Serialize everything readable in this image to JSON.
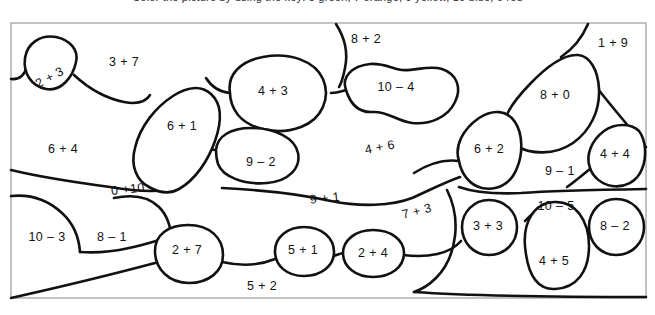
{
  "page": {
    "kind": "coloring-worksheet",
    "top_cut_text": "Color the picture by using the key: 5 green, 7 orange, 9 yellow, 10 blue, 6 red",
    "frame": {
      "x": 11,
      "y": 23,
      "width": 635,
      "height": 275
    },
    "ink_color": "#111111",
    "paper_color": "#ffffff",
    "frame_color": "#9a9a9a"
  },
  "regions": [
    {
      "id": "r-2plus3",
      "label": "2 + 3",
      "x": 50,
      "y": 78,
      "rotate": -28
    },
    {
      "id": "r-3plus7",
      "label": "3 + 7",
      "x": 124,
      "y": 63,
      "rotate": 0
    },
    {
      "id": "r-6plus4",
      "label": "6 + 4",
      "x": 63,
      "y": 150,
      "rotate": 0
    },
    {
      "id": "r-6plus1",
      "label": "6 + 1",
      "x": 182,
      "y": 127,
      "rotate": 0
    },
    {
      "id": "r-0plus10",
      "label": "0 +10",
      "x": 128,
      "y": 190,
      "rotate": -6
    },
    {
      "id": "r-10minus3",
      "label": "10 – 3",
      "x": 47,
      "y": 238,
      "rotate": 0
    },
    {
      "id": "r-8minus1",
      "label": "8 – 1",
      "x": 112,
      "y": 238,
      "rotate": 0
    },
    {
      "id": "r-2plus7",
      "label": "2 + 7",
      "x": 187,
      "y": 251,
      "rotate": 0
    },
    {
      "id": "r-4plus3",
      "label": "4 + 3",
      "x": 273,
      "y": 92,
      "rotate": 0
    },
    {
      "id": "r-9minus2",
      "label": "9 – 2",
      "x": 261,
      "y": 163,
      "rotate": 0
    },
    {
      "id": "r-5plus1",
      "label": "5 + 1",
      "x": 303,
      "y": 251,
      "rotate": 0
    },
    {
      "id": "r-2plus4",
      "label": "2 + 4",
      "x": 373,
      "y": 254,
      "rotate": 0
    },
    {
      "id": "r-5plus2",
      "label": "5 + 2",
      "x": 262,
      "y": 287,
      "rotate": 0
    },
    {
      "id": "r-9plus1",
      "label": "9 + 1",
      "x": 325,
      "y": 199,
      "rotate": -6
    },
    {
      "id": "r-8plus2",
      "label": "8 + 2",
      "x": 366,
      "y": 40,
      "rotate": 0
    },
    {
      "id": "r-10minus4",
      "label": "10 – 4",
      "x": 396,
      "y": 88,
      "rotate": 0
    },
    {
      "id": "r-4plus6",
      "label": "4 + 6",
      "x": 380,
      "y": 148,
      "rotate": -11
    },
    {
      "id": "r-7plus3",
      "label": "7 + 3",
      "x": 417,
      "y": 212,
      "rotate": -14
    },
    {
      "id": "r-6plus2",
      "label": "6 + 2",
      "x": 489,
      "y": 150,
      "rotate": 0
    },
    {
      "id": "r-8plus0",
      "label": "8 + 0",
      "x": 555,
      "y": 96,
      "rotate": 0
    },
    {
      "id": "r-1plus9",
      "label": "1 + 9",
      "x": 613,
      "y": 44,
      "rotate": 0
    },
    {
      "id": "r-9minus1",
      "label": "9 – 1",
      "x": 560,
      "y": 172,
      "rotate": 0
    },
    {
      "id": "r-4plus4",
      "label": "4 + 4",
      "x": 615,
      "y": 155,
      "rotate": 0
    },
    {
      "id": "r-3plus3",
      "label": "3 + 3",
      "x": 488,
      "y": 227,
      "rotate": 0
    },
    {
      "id": "r-10minus5",
      "label": "10 – 5",
      "x": 556,
      "y": 207,
      "rotate": 0
    },
    {
      "id": "r-4plus5",
      "label": "4 + 5",
      "x": 554,
      "y": 262,
      "rotate": 0
    },
    {
      "id": "r-8minus2",
      "label": "8 – 2",
      "x": 615,
      "y": 227,
      "rotate": 0
    }
  ],
  "shapes": {
    "outer_frame": "M11,23 L646,23 L646,298 L11,298 Z",
    "blob_2plus3": "M75,62 C78,51 70,41 56,38 C40,35 28,44 25,58 C22,72 30,85 45,88 C60,91 72,77 75,62 Z",
    "blob_6plus1": "M148,186 C136,180 130,166 134,148 C139,126 155,108 172,97 C186,88 200,86 210,94 C221,103 221,121 214,140 C207,160 194,179 178,188 C166,195 155,190 148,186 Z",
    "blob_4plus3": "M229,93 C226,76 239,62 262,58 C289,53 314,62 322,79 C330,97 321,118 300,126 C276,135 249,128 237,114 C231,106 229,99 229,93 Z",
    "blob_9minus2": "M215,148 C216,135 230,128 250,128 C274,128 294,137 297,152 C300,167 288,180 266,182 C243,184 222,176 217,163 C215,157 215,152 215,148 Z",
    "blob_10minus4": "M346,90 C342,78 352,67 370,65 C383,64 392,70 401,71 C414,72 428,66 441,70 C455,75 460,88 454,101 C447,116 430,124 412,122 C396,120 386,111 373,111 C358,112 350,103 346,90 Z",
    "blob_8plus0": "M505,132 C500,120 510,105 528,86 C545,68 563,55 577,56 C589,57 597,70 598,88 C599,110 589,131 572,142 C553,155 529,153 515,145 C509,141 506,137 505,132 Z",
    "blob_6plus2": "M459,160 C454,146 462,130 478,119 C492,110 506,111 514,122 C522,134 522,154 516,168 C510,183 496,190 481,187 C468,184 461,172 459,160 Z",
    "blob_4plus4": "M590,168 C585,156 591,141 603,132 C614,124 630,124 638,132 C645,140 646,157 641,169 C636,181 623,187 611,185 C600,183 593,177 590,168 Z",
    "blob_3plus3": "M463,227 C463,212 474,201 489,201 C505,201 516,212 516,227 C516,243 505,254 489,254 C474,254 463,243 463,227 Z",
    "blob_4plus5": "M524,245 C522,222 533,203 554,202 C576,201 589,220 589,245 C589,270 577,287 555,288 C534,289 526,268 524,245 Z",
    "blob_8minus2": "M590,227 C590,211 601,200 616,200 C632,200 643,211 643,227 C643,243 632,254 616,254 C601,254 590,243 590,227 Z",
    "blob_2plus7": "M155,251 C155,236 167,226 187,226 C209,226 222,238 222,254 C222,271 207,282 188,282 C168,282 155,269 155,251 Z",
    "blob_5plus1": "M275,251 C275,237 288,228 304,228 C321,228 333,238 333,252 C333,266 320,275 303,275 C287,275 275,265 275,251 Z",
    "blob_2plus4": "M343,253 C343,240 356,231 373,231 C390,231 403,240 403,253 C403,267 390,276 373,276 C356,276 343,267 343,253 Z",
    "divider_top_left": "M11,78 C20,79 24,73 26,66",
    "divider_2to3": "M75,72 C88,84 104,96 124,101 C140,105 148,101 150,96",
    "divider_8plus2_stem": "M337,24 C343,36 346,52 344,66 C343,75 341,82 339,86",
    "divider_1plus9_stem": "M586,24 C580,37 572,48 560,56",
    "divider_4plus6": "M11,170 C40,176 80,182 110,186 C135,190 152,191 168,189",
    "divider_mid_band": "M222,188 C262,190 300,193 332,200 C360,206 392,206 412,198 C428,191 442,182 459,177",
    "divider_0to10": "M113,197 C132,193 148,196 158,206 C167,215 170,226 172,236",
    "divider_10minus3": "M11,196 C30,194 48,199 62,212 C74,223 79,238 80,252",
    "divider_8minus1": "M80,252 C92,253 110,252 128,248 C142,245 152,242 160,240",
    "divider_bottom_sweep": "M11,298 C60,286 110,274 155,262",
    "divider_bottom_right": "M222,269 C240,272 258,274 275,264",
    "divider_5to2": "M333,259 C338,258 340,257 343,256",
    "divider_2plus4_right": "M403,256 C430,258 452,254 463,240",
    "divider_right_band": "M459,186 C475,192 500,193 520,192 C548,190 588,189 646,188",
    "divider_right_band_low": "M446,190 C452,200 456,218 454,236 C452,252 446,268 436,278 C428,286 420,290 414,292",
    "divider_bottom_right_sweep": "M414,292 C470,296 540,297 646,297",
    "divider_9minus1_split": "M590,168 C580,176 572,182 566,186",
    "divider_6plus2_left": "M459,160 C444,158 428,163 414,172",
    "divider_1plus9_edge": "M598,88 C612,106 628,126 646,146",
    "divider_top_right_edge": "M505,132 C496,140 486,149 476,157",
    "divider_4plus3_stem": "M229,93 C218,92 210,86 205,78",
    "divider_9minus2_stem": "M276,126 C278,130 278,133 278,137",
    "divider_4plus5_top": "M524,220 C530,214 540,208 552,205",
    "divider_frame_left_mid": "M11,196 L11,196"
  }
}
